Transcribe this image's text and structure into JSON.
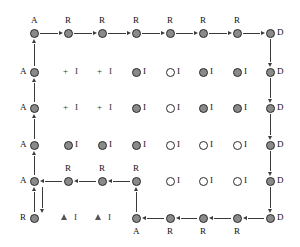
{
  "diagram": {
    "colors": {
      "node_fill": "#8a8a8a",
      "node_stroke": "#2b2b2b",
      "node_hollow": "#ffffff",
      "edge": "#3a3a3a",
      "text": "#111111",
      "background": "#ffffff"
    },
    "geometry": {
      "cols_x": [
        34,
        68,
        102,
        136,
        170,
        203,
        237,
        270
      ],
      "rows_y": [
        33,
        72,
        108,
        145,
        181,
        218
      ],
      "node_radius": 4.5
    },
    "nodes": [
      {
        "id": "n-r1c1",
        "row": 0,
        "col": 0,
        "state": "filled",
        "label": "A",
        "label_pos": "above"
      },
      {
        "id": "n-r1c2",
        "row": 0,
        "col": 1,
        "state": "filled",
        "label": "R",
        "label_pos": "above"
      },
      {
        "id": "n-r1c3",
        "row": 0,
        "col": 2,
        "state": "filled",
        "label": "R",
        "label_pos": "above"
      },
      {
        "id": "n-r1c4",
        "row": 0,
        "col": 3,
        "state": "filled",
        "label": "R",
        "label_pos": "above"
      },
      {
        "id": "n-r1c5",
        "row": 0,
        "col": 4,
        "state": "filled",
        "label": "R",
        "label_pos": "above"
      },
      {
        "id": "n-r1c6",
        "row": 0,
        "col": 5,
        "state": "filled",
        "label": "R",
        "label_pos": "above"
      },
      {
        "id": "n-r1c7",
        "row": 0,
        "col": 6,
        "state": "filled",
        "label": "R",
        "label_pos": "above"
      },
      {
        "id": "n-r1c8",
        "row": 0,
        "col": 7,
        "state": "filled",
        "label": "D",
        "label_pos": "right"
      },
      {
        "id": "n-r2c1",
        "row": 1,
        "col": 0,
        "state": "filled",
        "label": "A",
        "label_pos": "left"
      },
      {
        "id": "n-r2c4",
        "row": 1,
        "col": 3,
        "state": "filled",
        "label": "I",
        "label_pos": "right"
      },
      {
        "id": "n-r2c5",
        "row": 1,
        "col": 4,
        "state": "hollow",
        "label": "I",
        "label_pos": "right"
      },
      {
        "id": "n-r2c6",
        "row": 1,
        "col": 5,
        "state": "filled",
        "label": "I",
        "label_pos": "right"
      },
      {
        "id": "n-r2c7",
        "row": 1,
        "col": 6,
        "state": "filled",
        "label": "I",
        "label_pos": "right"
      },
      {
        "id": "n-r2c8",
        "row": 1,
        "col": 7,
        "state": "filled",
        "label": "D",
        "label_pos": "right"
      },
      {
        "id": "n-r3c1",
        "row": 2,
        "col": 0,
        "state": "filled",
        "label": "A",
        "label_pos": "left"
      },
      {
        "id": "n-r3c4",
        "row": 2,
        "col": 3,
        "state": "filled",
        "label": "I",
        "label_pos": "right"
      },
      {
        "id": "n-r3c5",
        "row": 2,
        "col": 4,
        "state": "hollow",
        "label": "I",
        "label_pos": "right"
      },
      {
        "id": "n-r3c6",
        "row": 2,
        "col": 5,
        "state": "filled",
        "label": "I",
        "label_pos": "right"
      },
      {
        "id": "n-r3c7",
        "row": 2,
        "col": 6,
        "state": "filled",
        "label": "I",
        "label_pos": "right"
      },
      {
        "id": "n-r3c8",
        "row": 2,
        "col": 7,
        "state": "filled",
        "label": "D",
        "label_pos": "right"
      },
      {
        "id": "n-r4c1",
        "row": 3,
        "col": 0,
        "state": "filled",
        "label": "A",
        "label_pos": "left"
      },
      {
        "id": "n-r4c2",
        "row": 3,
        "col": 1,
        "state": "filled",
        "label": "I",
        "label_pos": "right"
      },
      {
        "id": "n-r4c3",
        "row": 3,
        "col": 2,
        "state": "filled",
        "label": "I",
        "label_pos": "right"
      },
      {
        "id": "n-r4c4",
        "row": 3,
        "col": 3,
        "state": "filled",
        "label": "I",
        "label_pos": "right"
      },
      {
        "id": "n-r4c5",
        "row": 3,
        "col": 4,
        "state": "hollow",
        "label": "I",
        "label_pos": "right"
      },
      {
        "id": "n-r4c6",
        "row": 3,
        "col": 5,
        "state": "hollow",
        "label": "I",
        "label_pos": "right"
      },
      {
        "id": "n-r4c7",
        "row": 3,
        "col": 6,
        "state": "hollow",
        "label": "I",
        "label_pos": "right"
      },
      {
        "id": "n-r4c8",
        "row": 3,
        "col": 7,
        "state": "filled",
        "label": "D",
        "label_pos": "right"
      },
      {
        "id": "n-r5c1",
        "row": 4,
        "col": 0,
        "state": "filled",
        "label": "A",
        "label_pos": "left"
      },
      {
        "id": "n-r5c2",
        "row": 4,
        "col": 1,
        "state": "filled",
        "label": "R",
        "label_pos": "above"
      },
      {
        "id": "n-r5c3",
        "row": 4,
        "col": 2,
        "state": "filled",
        "label": "R",
        "label_pos": "above"
      },
      {
        "id": "n-r5c4",
        "row": 4,
        "col": 3,
        "state": "filled",
        "label": "R",
        "label_pos": "above"
      },
      {
        "id": "n-r5c5",
        "row": 4,
        "col": 4,
        "state": "hollow",
        "label": "I",
        "label_pos": "right"
      },
      {
        "id": "n-r5c6",
        "row": 4,
        "col": 5,
        "state": "hollow",
        "label": "I",
        "label_pos": "right"
      },
      {
        "id": "n-r5c7",
        "row": 4,
        "col": 6,
        "state": "hollow",
        "label": "I",
        "label_pos": "right"
      },
      {
        "id": "n-r5c8",
        "row": 4,
        "col": 7,
        "state": "filled",
        "label": "D",
        "label_pos": "right"
      },
      {
        "id": "n-r6c1",
        "row": 5,
        "col": 0,
        "state": "filled",
        "label": "R",
        "label_pos": "left"
      },
      {
        "id": "n-r6c4",
        "row": 5,
        "col": 3,
        "state": "filled",
        "label": "A",
        "label_pos": "below"
      },
      {
        "id": "n-r6c5",
        "row": 5,
        "col": 4,
        "state": "filled",
        "label": "R",
        "label_pos": "below"
      },
      {
        "id": "n-r6c6",
        "row": 5,
        "col": 5,
        "state": "filled",
        "label": "R",
        "label_pos": "below"
      },
      {
        "id": "n-r6c7",
        "row": 5,
        "col": 6,
        "state": "filled",
        "label": "R",
        "label_pos": "below"
      },
      {
        "id": "n-r6c8",
        "row": 5,
        "col": 7,
        "state": "filled",
        "label": "D",
        "label_pos": "right"
      }
    ],
    "plus_symbols": [
      {
        "id": "plus-r2c2",
        "row": 1,
        "col": 1,
        "glyph": "+",
        "label": "I"
      },
      {
        "id": "plus-r2c3",
        "row": 1,
        "col": 2,
        "glyph": "+",
        "label": "I"
      },
      {
        "id": "plus-r3c2",
        "row": 2,
        "col": 1,
        "glyph": "+",
        "label": "I"
      },
      {
        "id": "plus-r3c3",
        "row": 2,
        "col": 2,
        "glyph": "+",
        "label": "I"
      }
    ],
    "triangle_symbols": [
      {
        "id": "tri-r6c2",
        "row": 5,
        "col": 1,
        "glyph": "triangle",
        "label": "I"
      },
      {
        "id": "tri-r6c3",
        "row": 5,
        "col": 2,
        "glyph": "triangle",
        "label": "I"
      }
    ],
    "edges": [
      {
        "id": "e-top-1",
        "from": "n-r1c1",
        "to": "n-r1c2",
        "dir": "right"
      },
      {
        "id": "e-top-2",
        "from": "n-r1c2",
        "to": "n-r1c3",
        "dir": "right"
      },
      {
        "id": "e-top-3",
        "from": "n-r1c3",
        "to": "n-r1c4",
        "dir": "right"
      },
      {
        "id": "e-top-4",
        "from": "n-r1c4",
        "to": "n-r1c5",
        "dir": "right"
      },
      {
        "id": "e-top-5",
        "from": "n-r1c5",
        "to": "n-r1c6",
        "dir": "right"
      },
      {
        "id": "e-top-6",
        "from": "n-r1c6",
        "to": "n-r1c7",
        "dir": "right"
      },
      {
        "id": "e-top-7",
        "from": "n-r1c7",
        "to": "n-r1c8",
        "dir": "right"
      },
      {
        "id": "e-right-1",
        "from": "n-r1c8",
        "to": "n-r2c8",
        "dir": "down"
      },
      {
        "id": "e-right-2",
        "from": "n-r2c8",
        "to": "n-r3c8",
        "dir": "down"
      },
      {
        "id": "e-right-3",
        "from": "n-r3c8",
        "to": "n-r4c8",
        "dir": "down"
      },
      {
        "id": "e-right-4",
        "from": "n-r4c8",
        "to": "n-r5c8",
        "dir": "down"
      },
      {
        "id": "e-right-5",
        "from": "n-r5c8",
        "to": "n-r6c8",
        "dir": "down"
      },
      {
        "id": "e-bottom-1",
        "from": "n-r6c8",
        "to": "n-r6c7",
        "dir": "left"
      },
      {
        "id": "e-bottom-2",
        "from": "n-r6c7",
        "to": "n-r6c6",
        "dir": "left"
      },
      {
        "id": "e-bottom-3",
        "from": "n-r6c6",
        "to": "n-r6c5",
        "dir": "left"
      },
      {
        "id": "e-bottom-4",
        "from": "n-r6c5",
        "to": "n-r6c4",
        "dir": "left"
      },
      {
        "id": "e-mid-up",
        "from": "n-r6c4",
        "to": "n-r5c4",
        "dir": "up"
      },
      {
        "id": "e-mid-1",
        "from": "n-r5c4",
        "to": "n-r5c3",
        "dir": "left"
      },
      {
        "id": "e-mid-2",
        "from": "n-r5c3",
        "to": "n-r5c2",
        "dir": "left"
      },
      {
        "id": "e-mid-3",
        "from": "n-r5c2",
        "to": "n-r5c1",
        "dir": "left"
      },
      {
        "id": "e-left-1",
        "from": "n-r2c1",
        "to": "n-r1c1",
        "dir": "up"
      },
      {
        "id": "e-left-2",
        "from": "n-r3c1",
        "to": "n-r2c1",
        "dir": "up"
      },
      {
        "id": "e-left-3",
        "from": "n-r4c1",
        "to": "n-r3c1",
        "dir": "up"
      },
      {
        "id": "e-left-4",
        "from": "n-r5c1",
        "to": "n-r4c1",
        "dir": "up"
      },
      {
        "id": "e-left-5",
        "from": "n-r6c1",
        "to": "n-r5c1",
        "dir": "up"
      },
      {
        "id": "e-left-6-down",
        "from": "n-r5c1",
        "to": "n-r6c1",
        "dir": "down",
        "offset": 8
      }
    ]
  }
}
